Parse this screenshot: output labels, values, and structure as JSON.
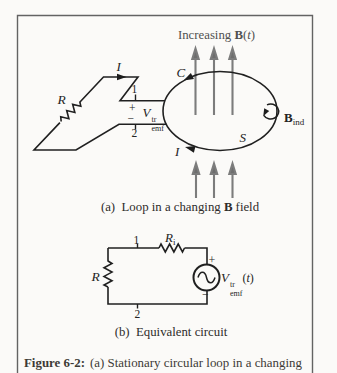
{
  "part_a": {
    "field_label_pre": "Increasing ",
    "field_label_B": "B",
    "field_label_open": "(",
    "field_label_t": "t",
    "field_label_close": ")",
    "current_top": "I",
    "contour": "C",
    "resistor": "R",
    "terminal_top": "1",
    "plus": "+",
    "emf_V": "V",
    "emf_sup": "tr",
    "emf_sub": "emf",
    "minus": "−",
    "terminal_bottom": "2",
    "current_bottom": "I",
    "surface": "S",
    "induced_B": "B",
    "induced_sub": "ind",
    "caption_pre": "(a)  Loop in a changing ",
    "caption_B": "B",
    "caption_post": " field"
  },
  "part_b": {
    "node_top": "1",
    "internal_R": "R",
    "internal_R_sub": "i",
    "resistor": "R",
    "plus": "+",
    "minus": "−",
    "source_V": "V",
    "source_sup": "tr",
    "source_sub": "emf",
    "source_open": "(",
    "source_t": "t",
    "source_close": ")",
    "node_bottom": "2",
    "caption": "(b)  Equivalent circuit"
  },
  "figure_caption": {
    "label": "Figure 6-2:",
    "text": "(a) Stationary circular loop in a changing"
  },
  "colors": {
    "line": "#202020",
    "field_arrow": "#7c7c7c",
    "border": "#636363",
    "caption_text": "#3d3a36"
  }
}
